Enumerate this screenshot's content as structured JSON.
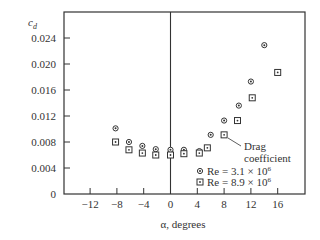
{
  "chart_data": {
    "type": "scatter",
    "title": "",
    "xlabel": "α, degrees",
    "ylabel": "c_d",
    "xlim": [
      -18,
      20
    ],
    "ylim": [
      0,
      0.0274
    ],
    "grid": false,
    "xticks": [
      -12,
      -8,
      -4,
      0,
      4,
      8,
      12,
      16
    ],
    "xtick_labels": [
      "−12",
      "−8",
      "−4",
      "0",
      "4",
      "8",
      "12",
      "16"
    ],
    "yticks": [
      0,
      0.004,
      0.008,
      0.012,
      0.016,
      0.02,
      0.024
    ],
    "ytick_labels": [
      "0",
      "0.004",
      "0.008",
      "0.012",
      "0.016",
      "0.020",
      "0.024"
    ],
    "legend_position": "lower right inside",
    "series": [
      {
        "name": "Re = 3.1 × 10^6",
        "marker": "circle-dot",
        "x": [
          -8.2,
          -6.2,
          -4.2,
          -2.2,
          0,
          2,
          4.3,
          6,
          8,
          10.2,
          12,
          14
        ],
        "y": [
          0.0101,
          0.008,
          0.0074,
          0.0069,
          0.0068,
          0.0068,
          0.0066,
          0.0091,
          0.0113,
          0.0136,
          0.0173,
          0.0229
        ]
      },
      {
        "name": "Re = 8.9 × 10^6",
        "marker": "square-dot",
        "x": [
          -8.2,
          -6.2,
          -4.2,
          -2.2,
          0,
          2,
          4.3,
          5.5,
          8,
          10,
          12.2,
          16
        ],
        "y": [
          0.008,
          0.0068,
          0.0063,
          0.006,
          0.006,
          0.0062,
          0.0063,
          0.0071,
          0.0091,
          0.0113,
          0.0148,
          0.0187
        ]
      }
    ],
    "annotations": [
      {
        "text": "Drag",
        "line": 1
      },
      {
        "text": "coefficient",
        "line": 2
      }
    ]
  },
  "labels": {
    "ylabel_main": "c",
    "ylabel_sub": "d",
    "xlabel": "α, degrees",
    "legend": [
      {
        "prefix": "Re = 3.1 × 10",
        "exp": "6"
      },
      {
        "prefix": "Re = 8.9 × 10",
        "exp": "6"
      }
    ],
    "annotation_line1": "Drag",
    "annotation_line2": "coefficient"
  }
}
